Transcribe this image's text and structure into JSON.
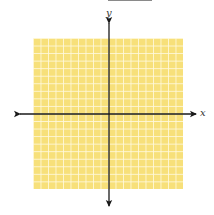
{
  "diagram": {
    "type": "coordinate-plane",
    "grid": {
      "columns": 20,
      "rows": 20,
      "fill_color": "#f7e07a",
      "line_color": "#fffae1"
    },
    "axes": {
      "x_label": "x",
      "y_label": "y",
      "color": "#1a1a1a",
      "arrows": "both-ends"
    }
  }
}
